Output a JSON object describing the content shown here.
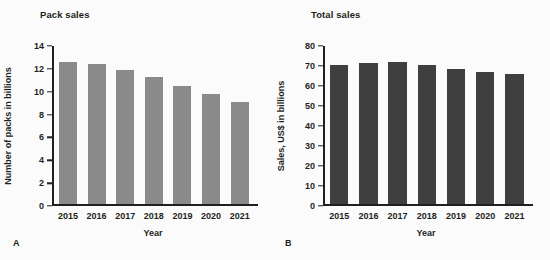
{
  "figure": {
    "background_color": "#fbfbfb",
    "panels": [
      {
        "letter": "A",
        "title": "Pack sales",
        "bar_color": "#8a8a8a"
      },
      {
        "letter": "B",
        "title": "Total sales",
        "bar_color": "#3f3f3f"
      }
    ]
  },
  "chart_data": [
    {
      "type": "bar",
      "panel": "A",
      "title": "Pack sales",
      "xlabel": "Year",
      "ylabel": "Number of packs in billions",
      "categories": [
        "2015",
        "2016",
        "2017",
        "2018",
        "2019",
        "2020",
        "2021"
      ],
      "values": [
        12.6,
        12.4,
        11.9,
        11.3,
        10.5,
        9.8,
        9.05
      ],
      "ylim": [
        0,
        14
      ],
      "yticks": [
        0,
        2,
        4,
        6,
        8,
        10,
        12,
        14
      ],
      "ytick_labels": [
        "0",
        "2",
        "4",
        "6",
        "8",
        "10",
        "12",
        "14"
      ],
      "grid": false,
      "legend": "none",
      "bar_color": "#8a8a8a"
    },
    {
      "type": "bar",
      "panel": "B",
      "title": "Total sales",
      "xlabel": "Year",
      "ylabel": "Sales, US$ in billions",
      "categories": [
        "2015",
        "2016",
        "2017",
        "2018",
        "2019",
        "2020",
        "2021"
      ],
      "values": [
        70.2,
        71.2,
        72.0,
        70.4,
        68.5,
        67.0,
        66.0
      ],
      "ylim": [
        0,
        80
      ],
      "yticks": [
        0,
        10,
        20,
        30,
        40,
        50,
        60,
        70,
        80
      ],
      "ytick_labels": [
        "0",
        "10",
        "20",
        "30",
        "40",
        "50",
        "60",
        "70",
        "80"
      ],
      "grid": false,
      "legend": "none",
      "bar_color": "#3f3f3f"
    }
  ]
}
